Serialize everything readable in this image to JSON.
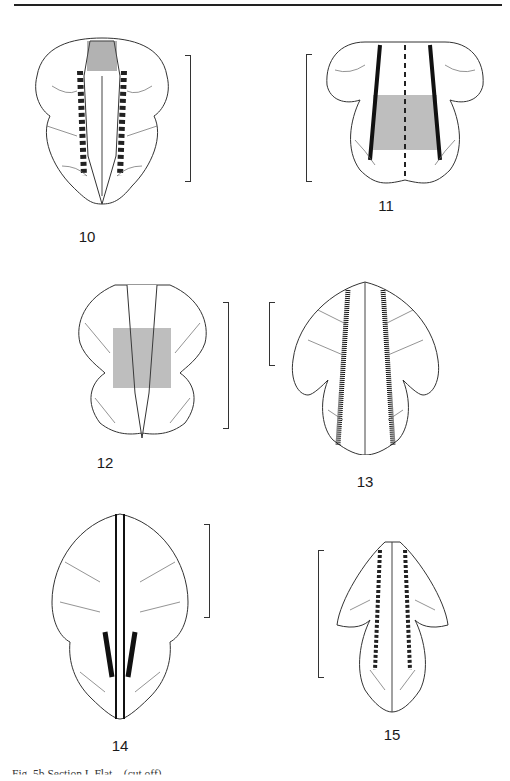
{
  "page": {
    "top_rule": true,
    "caption": "Fig. 5b Section I. Flat... (cut off)"
  },
  "figures": [
    {
      "id": "10",
      "label": "10"
    },
    {
      "id": "11",
      "label": "11"
    },
    {
      "id": "12",
      "label": "12"
    },
    {
      "id": "13",
      "label": "13"
    },
    {
      "id": "14",
      "label": "14"
    },
    {
      "id": "15",
      "label": "15"
    }
  ],
  "colors": {
    "ink": "#1a1a1a",
    "paper": "#ffffff"
  }
}
